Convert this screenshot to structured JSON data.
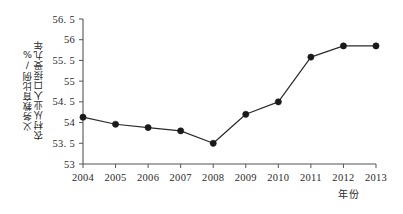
{
  "chart_data": {
    "type": "line",
    "title": "",
    "xlabel": "年份",
    "ylabel": "农村从业人口接受九年义务教育比例/%",
    "ylabel_line1": "农村从业人口接受九年",
    "ylabel_line2": "义务教育比例/%",
    "categories": [
      "2004",
      "2005",
      "2006",
      "2007",
      "2008",
      "2009",
      "2010",
      "2011",
      "2012",
      "2013"
    ],
    "x": [
      2004,
      2005,
      2006,
      2007,
      2008,
      2009,
      2010,
      2011,
      2012,
      2013
    ],
    "values": [
      54.13,
      53.96,
      53.88,
      53.8,
      53.5,
      54.2,
      54.5,
      55.58,
      55.85,
      55.85
    ],
    "ylim": [
      53,
      56.5
    ],
    "xlim": [
      2004,
      2013
    ],
    "ytick_values": [
      53,
      53.5,
      54,
      54.5,
      55,
      55.5,
      56,
      56.5
    ],
    "ytick_labels": [
      "53",
      "53. 5",
      "54",
      "54. 5",
      "55",
      "55. 5",
      "56",
      "56. 5"
    ],
    "xtick_labels": [
      "2004",
      "2005",
      "2006",
      "2007",
      "2008",
      "2009",
      "2010",
      "2011",
      "2012",
      "2013"
    ],
    "grid": false,
    "legend": false,
    "legend_position": "none",
    "marker": "filled-circle",
    "line_color": "#2b2b2b",
    "marker_color": "#1a1a1a",
    "axis_color": "#555555",
    "background_color": "#ffffff"
  }
}
